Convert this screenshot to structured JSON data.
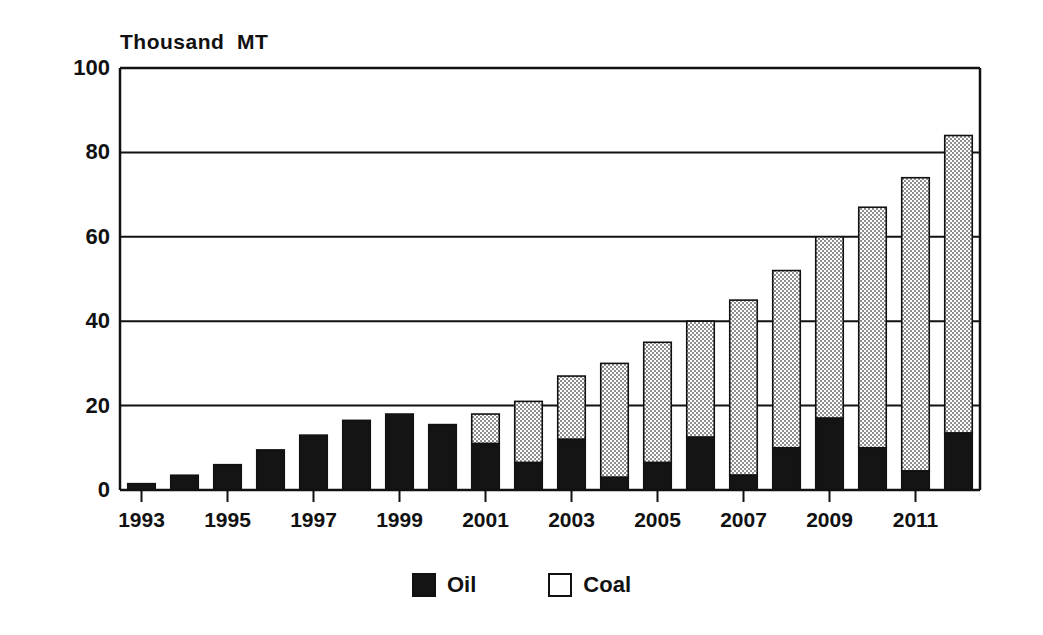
{
  "chart_data": {
    "type": "bar",
    "subtype": "stacked-vertical",
    "title": "",
    "ylabel": "Thousand  MT",
    "xlabel": "",
    "ylim": [
      0,
      100
    ],
    "yticks": [
      0,
      20,
      40,
      60,
      80,
      100
    ],
    "grid": true,
    "grid_axis": "y",
    "legend_position": "bottom-center",
    "categories": [
      "1993",
      "1994",
      "1995",
      "1996",
      "1997",
      "1998",
      "1999",
      "2000",
      "2001",
      "2002",
      "2003",
      "2004",
      "2005",
      "2006",
      "2007",
      "2008",
      "2009",
      "2010",
      "2011",
      "2012"
    ],
    "xtick_labels": [
      "1993",
      "1995",
      "1997",
      "1999",
      "2001",
      "2003",
      "2005",
      "2007",
      "2009",
      "2011"
    ],
    "xtick_categories": [
      "1993",
      "1995",
      "1997",
      "1999",
      "2001",
      "2003",
      "2005",
      "2007",
      "2009",
      "2011"
    ],
    "series": [
      {
        "name": "Oil",
        "color": "#141414",
        "pattern": "solid",
        "values": [
          1.5,
          3.5,
          6,
          9.5,
          13,
          16.5,
          18,
          15.5,
          11,
          6.5,
          12,
          3,
          6.5,
          12.5,
          3.5,
          10,
          17,
          10,
          4.5,
          13.5
        ]
      },
      {
        "name": "Coal",
        "color": "#b4b4b4",
        "pattern": "stipple",
        "values": [
          0,
          0,
          0,
          0,
          0,
          0,
          0,
          0,
          7,
          14.5,
          15,
          27,
          28.5,
          27.5,
          41.5,
          42,
          43,
          57,
          69.5,
          70.5
        ]
      }
    ],
    "totals": [
      1.5,
      3.5,
      6,
      9.5,
      13,
      16.5,
      18,
      15.5,
      18,
      21,
      27,
      30,
      35,
      40,
      45,
      52,
      60,
      67,
      74,
      84
    ]
  },
  "legend": {
    "items": [
      {
        "label": "Oil",
        "swatch": "filled-black-square"
      },
      {
        "label": "Coal",
        "swatch": "empty-white-square"
      }
    ]
  }
}
